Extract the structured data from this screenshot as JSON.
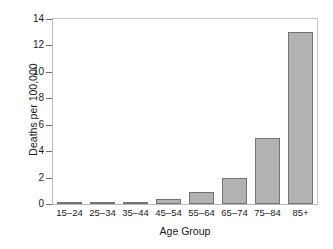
{
  "chart_data": {
    "type": "bar",
    "title": "",
    "subtitle": "",
    "xlabel": "Age Group",
    "ylabel": "Deaths per 100,000",
    "categories": [
      "15–24",
      "25–34",
      "35–44",
      "45–54",
      "55–64",
      "65–74",
      "75–84",
      "85+"
    ],
    "values": [
      0.05,
      0.08,
      0.15,
      0.4,
      0.9,
      2.0,
      5.0,
      13.0
    ],
    "ylim": [
      0,
      14
    ],
    "yticks": [
      0,
      2,
      4,
      6,
      8,
      10,
      12,
      14
    ],
    "ytick_labels": [
      "0",
      "2",
      "4",
      "6",
      "8",
      "10",
      "12",
      "14"
    ],
    "grid": false,
    "legend": false,
    "legend_position": "none",
    "bar_fill_color": "#b2b2b2",
    "bar_border_color": "#737373",
    "axis_color": "#6e6e6e",
    "frame_color": "#b9b9b9",
    "background_color": "#ffffff"
  }
}
